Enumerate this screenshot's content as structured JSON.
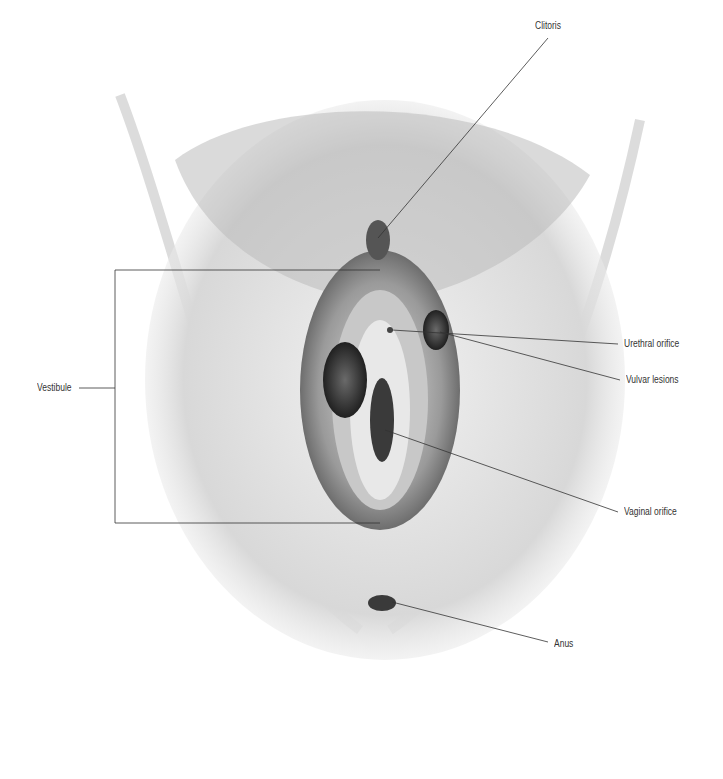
{
  "figure": {
    "type": "anatomical-illustration",
    "labels": [
      {
        "id": "clitoris",
        "text": "Clitoris",
        "x": 535,
        "y": 26
      },
      {
        "id": "urethral-orifice",
        "text": "Urethral orifice",
        "x": 624,
        "y": 338
      },
      {
        "id": "vulvar-lesions",
        "text": "Vulvar lesions",
        "x": 626,
        "y": 375
      },
      {
        "id": "vestibule",
        "text": "Vestibule",
        "x": 37,
        "y": 383
      },
      {
        "id": "vaginal-orifice",
        "text": "Vaginal orifice",
        "x": 624,
        "y": 508
      },
      {
        "id": "anus",
        "text": "Anus",
        "x": 554,
        "y": 638
      }
    ]
  }
}
